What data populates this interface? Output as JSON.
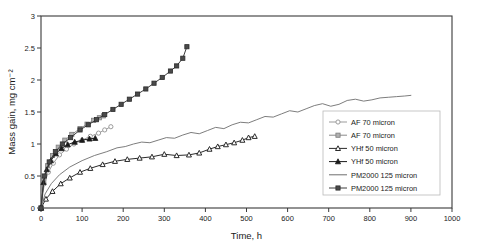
{
  "chart_data": {
    "type": "line",
    "title": "",
    "xlabel": "Time, h",
    "ylabel": "Mass gain, mg cm⁻²",
    "xlim": [
      0,
      1000
    ],
    "ylim": [
      0,
      3
    ],
    "xticks": [
      0,
      100,
      200,
      300,
      400,
      500,
      600,
      700,
      800,
      900,
      1000
    ],
    "xticklabels": [
      "0",
      "100",
      "200",
      "300",
      "400",
      "500",
      "600",
      "700",
      "800",
      "900",
      "1000"
    ],
    "yticks": [
      0,
      0.5,
      1,
      1.5,
      2,
      2.5,
      3
    ],
    "yticklabels": [
      "0",
      "0.5",
      "1",
      "1.5",
      "2",
      "2.5",
      "3"
    ],
    "grid": false,
    "legend_position": "lower-right-inside",
    "series": [
      {
        "name": "AF 70 micron",
        "marker": "open-circle",
        "color": "#9b9b9b",
        "x": [
          0,
          8,
          18,
          30,
          45,
          62,
          80,
          100,
          120,
          140,
          155,
          170
        ],
        "y": [
          0,
          0.38,
          0.56,
          0.7,
          0.83,
          0.92,
          1.0,
          1.06,
          1.12,
          1.17,
          1.22,
          1.27
        ]
      },
      {
        "name": "AF 70 micron",
        "marker": "filled-square-gray",
        "color": "#8a8a8a",
        "x": [
          0,
          7,
          16,
          28,
          42,
          58,
          75,
          95,
          112,
          128,
          142,
          152
        ],
        "y": [
          0,
          0.45,
          0.66,
          0.82,
          0.95,
          1.06,
          1.15,
          1.24,
          1.31,
          1.37,
          1.41,
          1.44
        ]
      },
      {
        "name": "YHf 50 micron",
        "marker": "open-triangle",
        "color": "#2a2a2a",
        "x": [
          0,
          12,
          28,
          48,
          70,
          95,
          120,
          150,
          180,
          210,
          240,
          270,
          300,
          330,
          360,
          385,
          410,
          430,
          450,
          470,
          490,
          505,
          520
        ],
        "y": [
          0,
          0.14,
          0.26,
          0.38,
          0.47,
          0.56,
          0.62,
          0.68,
          0.73,
          0.76,
          0.78,
          0.8,
          0.84,
          0.82,
          0.83,
          0.86,
          0.92,
          0.96,
          0.99,
          1.02,
          1.06,
          1.1,
          1.12
        ]
      },
      {
        "name": "YHf 50 micron",
        "marker": "filled-triangle",
        "color": "#1a1a1a",
        "x": [
          0,
          6,
          14,
          24,
          36,
          50,
          65,
          82,
          100,
          118,
          132
        ],
        "y": [
          0,
          0.4,
          0.6,
          0.74,
          0.85,
          0.93,
          0.99,
          1.03,
          1.06,
          1.08,
          1.09
        ]
      },
      {
        "name": "PM2000 125 micron",
        "marker": "none",
        "color": "#6e6e6e",
        "x": [
          0,
          10,
          25,
          45,
          70,
          100,
          130,
          160,
          185,
          205,
          225,
          245,
          265,
          285,
          305,
          325,
          345,
          365,
          385,
          405,
          425,
          445,
          465,
          485,
          505,
          525,
          545,
          565,
          585,
          605,
          625,
          645,
          665,
          685,
          705,
          725,
          745,
          765,
          785,
          805,
          825,
          845,
          865,
          885,
          900
        ],
        "y": [
          0,
          0.22,
          0.38,
          0.52,
          0.64,
          0.74,
          0.82,
          0.88,
          0.94,
          0.96,
          1.0,
          1.03,
          1.02,
          1.06,
          1.1,
          1.09,
          1.14,
          1.18,
          1.16,
          1.21,
          1.26,
          1.24,
          1.3,
          1.34,
          1.33,
          1.38,
          1.43,
          1.42,
          1.47,
          1.52,
          1.5,
          1.55,
          1.6,
          1.63,
          1.59,
          1.62,
          1.68,
          1.7,
          1.67,
          1.69,
          1.72,
          1.73,
          1.74,
          1.75,
          1.76
        ]
      },
      {
        "name": "PM2000 125 micron",
        "marker": "filled-square-dark",
        "color": "#3c3c3c",
        "x": [
          0,
          8,
          20,
          35,
          52,
          72,
          95,
          115,
          135,
          155,
          175,
          195,
          215,
          235,
          255,
          275,
          295,
          315,
          330,
          345,
          355
        ],
        "y": [
          0,
          0.5,
          0.72,
          0.88,
          1.0,
          1.1,
          1.22,
          1.3,
          1.38,
          1.46,
          1.54,
          1.62,
          1.7,
          1.78,
          1.86,
          1.95,
          2.04,
          2.14,
          2.22,
          2.34,
          2.52
        ]
      }
    ],
    "legend_entries": [
      {
        "label": "AF 70 micron",
        "marker": "open-circle",
        "color": "#9b9b9b"
      },
      {
        "label": "AF 70 micron",
        "marker": "filled-square-gray",
        "color": "#8a8a8a"
      },
      {
        "label": "YHf 50 micron",
        "marker": "open-triangle",
        "color": "#2a2a2a"
      },
      {
        "label": "YHf 50 micron",
        "marker": "filled-triangle",
        "color": "#1a1a1a"
      },
      {
        "label": "PM2000 125 micron",
        "marker": "none",
        "color": "#6e6e6e"
      },
      {
        "label": "PM2000 125 micron",
        "marker": "filled-square-dark",
        "color": "#3c3c3c"
      }
    ]
  }
}
